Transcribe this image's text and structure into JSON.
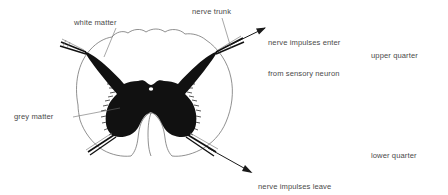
{
  "figure": {
    "background_color": "#ffffff",
    "outline_color": "#6b6b6b",
    "grey_matter_color": "#111111",
    "label_color": "#4a4a4a",
    "leader_line_color": "#6b6b6b"
  },
  "labels": {
    "white_matter": "white matter",
    "nerve_trunk": "nerve trunk",
    "sensory_line1": "nerve impulses enter",
    "sensory_line2": "from sensory neuron",
    "grey_matter": "grey matter",
    "motor_line1": "nerve impulses leave",
    "motor_line2": "by motor neuron",
    "upper_quarter": "upper quarter",
    "lower_quarter": "lower quarter"
  },
  "structures": {
    "grey_matter_name": "grey-matter-butterfly",
    "white_matter_name": "white-matter-region",
    "central_canal_name": "central-canal",
    "dorsal_root_name": "dorsal-nerve-root",
    "ventral_root_name": "ventral-nerve-root",
    "anterior_fissure_name": "anterior-median-fissure"
  },
  "arrows": {
    "sensory_direction": "up-right",
    "motor_direction": "down-right"
  }
}
